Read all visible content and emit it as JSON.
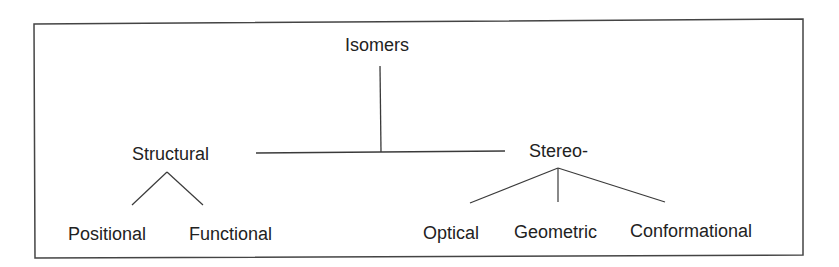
{
  "diagram": {
    "type": "tree",
    "root": {
      "label": "Isomers",
      "children": [
        {
          "label": "Structural",
          "children": [
            {
              "label": "Positional"
            },
            {
              "label": "Functional"
            }
          ]
        },
        {
          "label": "Stereo-",
          "children": [
            {
              "label": "Optical"
            },
            {
              "label": "Geometric"
            },
            {
              "label": "Conformational"
            }
          ]
        }
      ]
    }
  },
  "labels": {
    "isomers": "Isomers",
    "structural": "Structural",
    "stereo": "Stereo-",
    "positional": "Positional",
    "functional": "Functional",
    "optical": "Optical",
    "geometric": "Geometric",
    "conformational": "Conformational"
  },
  "colors": {
    "line": "#3a3a3a",
    "text": "#222222",
    "border": "#444444"
  }
}
